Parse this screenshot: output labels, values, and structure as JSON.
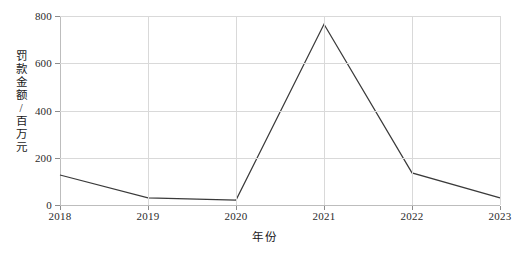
{
  "chart_data": {
    "type": "line",
    "title": "",
    "xlabel": "年份",
    "ylabel": "罚款金额/百万元",
    "categories": [
      "2018",
      "2019",
      "2020",
      "2021",
      "2022",
      "2023"
    ],
    "x": [
      2018,
      2019,
      2020,
      2021,
      2022,
      2023
    ],
    "values": [
      127,
      30,
      21,
      765,
      136,
      30
    ],
    "series": [
      {
        "name": "罚款金额",
        "values": [
          127,
          30,
          21,
          765,
          136,
          30
        ]
      }
    ],
    "xlim": [
      2018,
      2023
    ],
    "ylim": [
      0,
      800
    ],
    "yticks": [
      0,
      200,
      400,
      600,
      800
    ],
    "ytick_labels": [
      "0",
      "200",
      "400",
      "600",
      "800"
    ],
    "xticks": [
      2018,
      2019,
      2020,
      2021,
      2022,
      2023
    ],
    "xtick_labels": [
      "2018",
      "2019",
      "2020",
      "2021",
      "2022",
      "2023"
    ],
    "grid": true,
    "grid_color": "#d9d9d9",
    "legend": null,
    "legend_position": "none",
    "line_color": "#3a3a3a",
    "line_width": 1.2,
    "markers": false,
    "background": "#ffffff",
    "annotations": []
  }
}
